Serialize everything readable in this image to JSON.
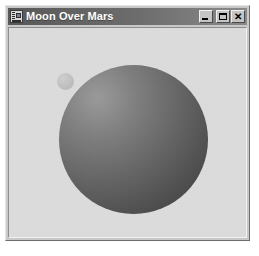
{
  "window": {
    "title": "Moon Over Mars",
    "icon": "application-window-icon",
    "controls": {
      "minimize_label": "_",
      "maximize_label": "□",
      "close_label": "✕"
    }
  },
  "scene": {
    "background_color": "#dcdcdc",
    "objects": [
      {
        "name": "mars",
        "shape": "sphere",
        "center_x": 131,
        "center_y": 137,
        "radius": 75,
        "light_direction": "upper-left",
        "highlight_color": "#9a9a9a",
        "shadow_color": "#3d3d3d"
      },
      {
        "name": "moon",
        "shape": "sphere",
        "center_x": 65,
        "center_y": 65,
        "radius": 9,
        "light_direction": "upper-left",
        "highlight_color": "#cfcfcf",
        "shadow_color": "#b5b5b5"
      }
    ]
  },
  "colors": {
    "title_bar_start": "#585858",
    "title_bar_end": "#8a8a8a",
    "title_text": "#ffffff",
    "window_face": "#c8c8c8",
    "client_background": "#dcdcdc"
  }
}
